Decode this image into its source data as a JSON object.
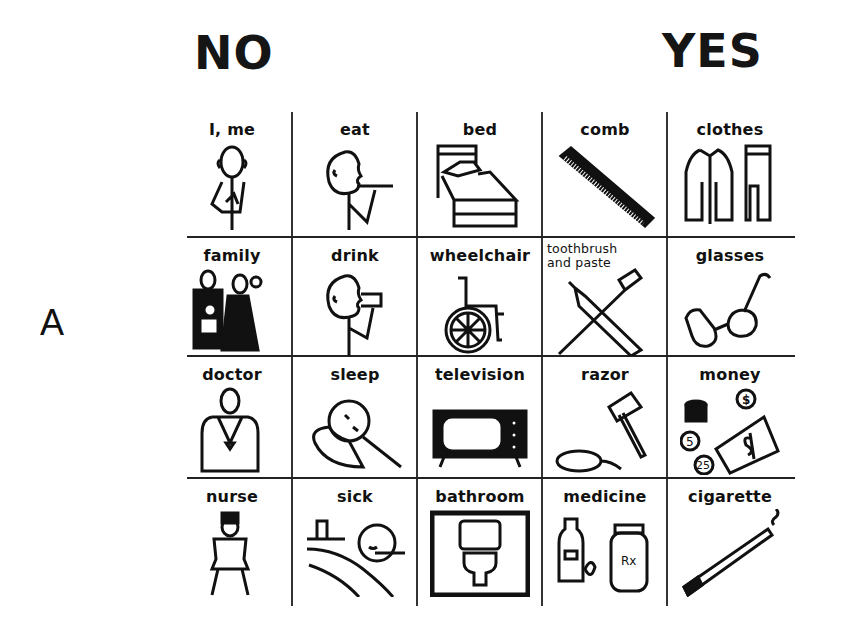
{
  "headings": {
    "no": "NO",
    "yes": "YES"
  },
  "panel_label": "A",
  "board": {
    "rows": [
      [
        {
          "label": "I, me",
          "icon": "person-pointing-self-icon"
        },
        {
          "label": "eat",
          "icon": "person-eating-icon"
        },
        {
          "label": "bed",
          "icon": "bed-icon"
        },
        {
          "label": "comb",
          "icon": "comb-icon"
        },
        {
          "label": "clothes",
          "icon": "clothes-icon"
        }
      ],
      [
        {
          "label": "family",
          "icon": "family-icon"
        },
        {
          "label": "drink",
          "icon": "person-drinking-icon"
        },
        {
          "label": "wheelchair",
          "icon": "wheelchair-icon"
        },
        {
          "label": "toothbrush and paste",
          "label_line1": "toothbrush",
          "label_line2": "and paste",
          "icon": "toothbrush-paste-icon"
        },
        {
          "label": "glasses",
          "icon": "glasses-icon"
        }
      ],
      [
        {
          "label": "doctor",
          "icon": "doctor-icon"
        },
        {
          "label": "sleep",
          "icon": "sleeping-person-icon"
        },
        {
          "label": "television",
          "icon": "television-icon"
        },
        {
          "label": "razor",
          "icon": "razor-icon"
        },
        {
          "label": "money",
          "icon": "money-icon",
          "coins": [
            "$",
            "5",
            "25"
          ]
        }
      ],
      [
        {
          "label": "nurse",
          "icon": "nurse-icon"
        },
        {
          "label": "sick",
          "icon": "sick-person-icon"
        },
        {
          "label": "bathroom",
          "icon": "toilet-icon"
        },
        {
          "label": "medicine",
          "icon": "medicine-icon",
          "jar_label": "Rx"
        },
        {
          "label": "cigarette",
          "icon": "cigarette-icon"
        }
      ]
    ]
  }
}
